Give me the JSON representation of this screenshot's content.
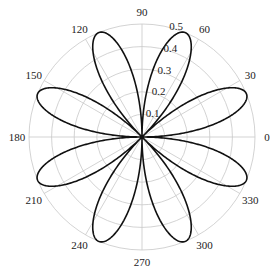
{
  "chart_data": {
    "type": "polar-line",
    "title": "",
    "equation_hint": "r = 0.5*|sin(4*theta)| (8-petal rose)",
    "series": [
      {
        "name": "rose",
        "color": "#111111",
        "petal_count": 8,
        "petal_max_r": 0.5,
        "petal_angles_deg": [
          22.5,
          67.5,
          112.5,
          157.5,
          202.5,
          247.5,
          292.5,
          337.5
        ]
      }
    ],
    "radial_axis": {
      "range": [
        0,
        0.5
      ],
      "ticks": [
        0.1,
        0.2,
        0.3,
        0.4,
        0.5
      ],
      "tick_labels": [
        "0.1",
        "0.2",
        "0.3",
        "0.4",
        "0.5"
      ],
      "label_angle_deg": 75
    },
    "angular_axis": {
      "ticks_deg": [
        0,
        30,
        60,
        90,
        120,
        150,
        180,
        210,
        240,
        270,
        300,
        330
      ],
      "tick_labels": [
        "0",
        "30",
        "60",
        "90",
        "120",
        "150",
        "180",
        "210",
        "240",
        "270",
        "300",
        "330"
      ]
    },
    "grid": true,
    "legend": null
  },
  "colors": {
    "grid": "#c8c8c8",
    "curve": "#111111",
    "background": "#ffffff"
  }
}
